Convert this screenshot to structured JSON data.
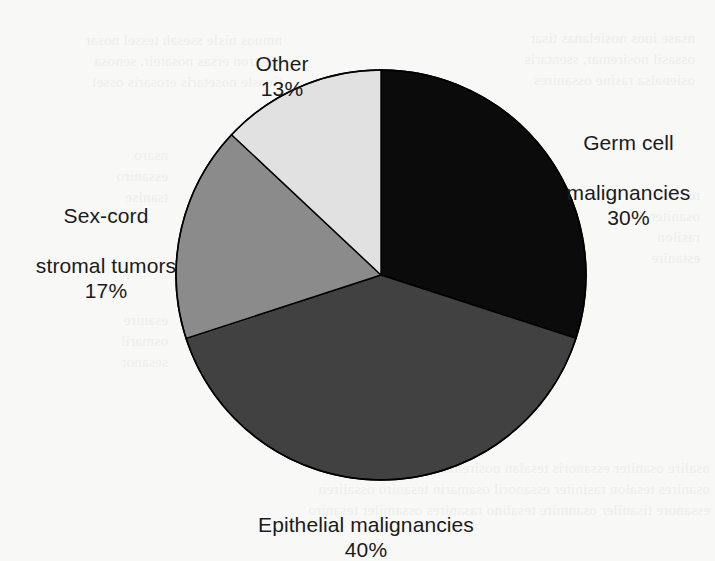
{
  "chart_data": {
    "type": "pie",
    "title": "",
    "subtitle": "",
    "xlabel": "",
    "ylabel": "",
    "legend_position": "none",
    "grid": false,
    "start_angle_deg": 0,
    "direction": "clockwise",
    "total_percent": 100,
    "categories": [
      "Germ cell malignancies",
      "Epithelial malignancies",
      "Sex-cord stromal tumors",
      "Other"
    ],
    "values": [
      30,
      40,
      17,
      13
    ],
    "value_labels": [
      "30%",
      "40%",
      "17%",
      "13%"
    ],
    "colors": [
      "#0b0b0b",
      "#414141",
      "#8b8b8b",
      "#e1e1e1"
    ],
    "slices": [
      {
        "name": "germ-cell-malignancies",
        "label_line1": "Germ cell",
        "label_line2": "malignancies",
        "percent_label": "30%",
        "value": 30,
        "color": "#0b0b0b",
        "start_deg": 0,
        "end_deg": 108
      },
      {
        "name": "epithelial-malignancies",
        "label_line1": "Epithelial malignancies",
        "label_line2": "",
        "percent_label": "40%",
        "value": 40,
        "color": "#414141",
        "start_deg": 108,
        "end_deg": 252
      },
      {
        "name": "sex-cord-stromal-tumors",
        "label_line1": "Sex-cord",
        "label_line2": "stromal tumors",
        "percent_label": "17%",
        "value": 17,
        "color": "#8b8b8b",
        "start_deg": 252,
        "end_deg": 313.2
      },
      {
        "name": "other",
        "label_line1": "Other",
        "label_line2": "",
        "percent_label": "13%",
        "value": 13,
        "color": "#e1e1e1",
        "start_deg": 313.2,
        "end_deg": 360
      }
    ]
  },
  "labels": {
    "other": {
      "line1": "Other",
      "percent": "13%"
    },
    "germ_cell": {
      "line1": "Germ cell",
      "line2": "malignancies",
      "percent": "30%"
    },
    "sex_cord": {
      "line1": "Sex-cord",
      "line2": "stromal tumors",
      "percent": "17%"
    },
    "epithelial": {
      "line1": "Epithelial malignancies",
      "percent": "40%"
    }
  },
  "geometry": {
    "center_x": 381,
    "center_y": 275,
    "radius": 205,
    "outline_color": "#000000"
  },
  "page": {
    "background_color": "#f8f8f6",
    "text_color": "#1b1b1b"
  },
  "scan_bleed": {
    "top_left": "nmuos nisle ssesah tessel nosar\nniletron ersas nosateir, senosa\ntinasle nosetaris erosaris ossel",
    "top_right": "nsase iuos nosielanas tisar\nossasil nosiremar, ssentaris\nosienalsa rasine ossanires",
    "mid_left": "nsaro\nessaniro\ntsanise",
    "mid_right": "nserasi\nosaniter\nrasilon\nestanire",
    "low_left": "esanire\nosmaril\nsesanor",
    "bottom": "nsalire osaniter essanoris tesalan nosiremar ossaniles tesarino\nosanires tesalon rasiniter essanoril osamarin tesaniro ossaliren\nessanore tisaniler osanmire tesalino rasanires ossamiler tesaniro"
  }
}
